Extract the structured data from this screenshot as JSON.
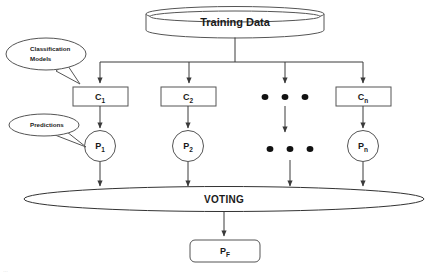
{
  "diagram": {
    "title_node": {
      "id": "training-data",
      "label": "Training Data",
      "shape": "cylinder"
    },
    "callouts": [
      {
        "id": "classification-models",
        "line1": "Classification",
        "line2": "Models",
        "points_to": "C1"
      },
      {
        "id": "predictions",
        "line1": "Predictions",
        "line2": "",
        "points_to": "P1"
      }
    ],
    "classifiers": [
      {
        "id": "C1",
        "base": "C",
        "subscript": "1",
        "shape": "rectangle"
      },
      {
        "id": "C2",
        "base": "C",
        "subscript": "2",
        "shape": "rectangle"
      },
      {
        "id": "Cn",
        "base": "C",
        "subscript": "n",
        "shape": "rectangle"
      }
    ],
    "predictions": [
      {
        "id": "P1",
        "base": "P",
        "subscript": "1",
        "shape": "circle"
      },
      {
        "id": "P2",
        "base": "P",
        "subscript": "2",
        "shape": "circle"
      },
      {
        "id": "Pn",
        "base": "P",
        "subscript": "n",
        "shape": "circle"
      }
    ],
    "ellipsis": {
      "glyph": "•",
      "count_per_row": 3,
      "rows": 2
    },
    "aggregator": {
      "id": "voting",
      "label": "VOTING",
      "shape": "ellipse"
    },
    "final_output": {
      "id": "PF",
      "base": "P",
      "subscript": "F",
      "shape": "rounded-rectangle"
    },
    "colors": {
      "background": "#ffffff",
      "shape_stroke": "#555555",
      "connector": "#3a3a3a",
      "text": "#1a1a1a",
      "dot": "#111111"
    },
    "caption": "…"
  }
}
